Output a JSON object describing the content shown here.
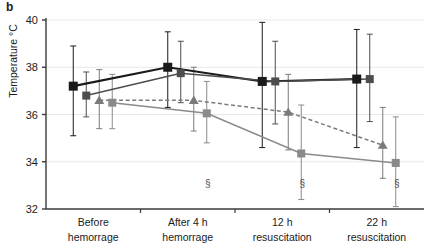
{
  "figure": {
    "panel_label": "b",
    "ylabel": "Temperature °C"
  },
  "chart_data": {
    "type": "line",
    "title": "",
    "xlabel": "",
    "ylabel": "Temperature °C",
    "ylim": [
      32,
      40
    ],
    "yticks": [
      32,
      34,
      36,
      38,
      40
    ],
    "ytick_labels": [
      "32",
      "34",
      "36",
      "38",
      "40"
    ],
    "grid": true,
    "legend_position": "none",
    "categories": [
      "Before hemorrage",
      "After 4 h hemorrage",
      "12 h resuscitation",
      "22 h resuscitation"
    ],
    "category_lines": [
      [
        "Before",
        "hemorrage"
      ],
      [
        "After 4 h",
        "hemorrage"
      ],
      [
        "12 h",
        "resuscitation"
      ],
      [
        "22 h",
        "resuscitation"
      ]
    ],
    "series": [
      {
        "name": "series-1",
        "marker": "square",
        "color": "#1a1a1a",
        "linestyle": "solid",
        "values": [
          37.2,
          38.0,
          37.4,
          37.5
        ],
        "err_low": [
          35.1,
          36.3,
          34.6,
          34.6
        ],
        "err_high": [
          38.9,
          39.5,
          39.9,
          39.6
        ]
      },
      {
        "name": "series-2",
        "marker": "square",
        "color": "#4d4d4d",
        "linestyle": "solid",
        "values": [
          36.8,
          37.75,
          37.4,
          37.5
        ],
        "err_low": [
          35.9,
          36.5,
          35.6,
          35.7
        ],
        "err_high": [
          37.8,
          39.1,
          39.1,
          39.4
        ]
      },
      {
        "name": "series-3",
        "marker": "triangle",
        "color": "#7a7a7a",
        "linestyle": "dashed",
        "values": [
          36.6,
          36.6,
          36.1,
          34.7
        ],
        "err_low": [
          35.4,
          35.3,
          34.5,
          33.3
        ],
        "err_high": [
          37.9,
          38.0,
          37.7,
          36.3
        ]
      },
      {
        "name": "series-4",
        "marker": "square",
        "color": "#8a8a8a",
        "linestyle": "solid",
        "values": [
          36.5,
          36.05,
          34.35,
          33.95
        ],
        "err_low": [
          35.4,
          34.8,
          32.4,
          32.1
        ],
        "err_high": [
          37.7,
          37.4,
          36.4,
          35.9
        ]
      }
    ],
    "annotations": [
      {
        "text": "§",
        "category_index": 1,
        "series_index": 3
      },
      {
        "text": "§",
        "category_index": 2,
        "series_index": 3
      },
      {
        "text": "§",
        "category_index": 3,
        "series_index": 3
      }
    ]
  }
}
